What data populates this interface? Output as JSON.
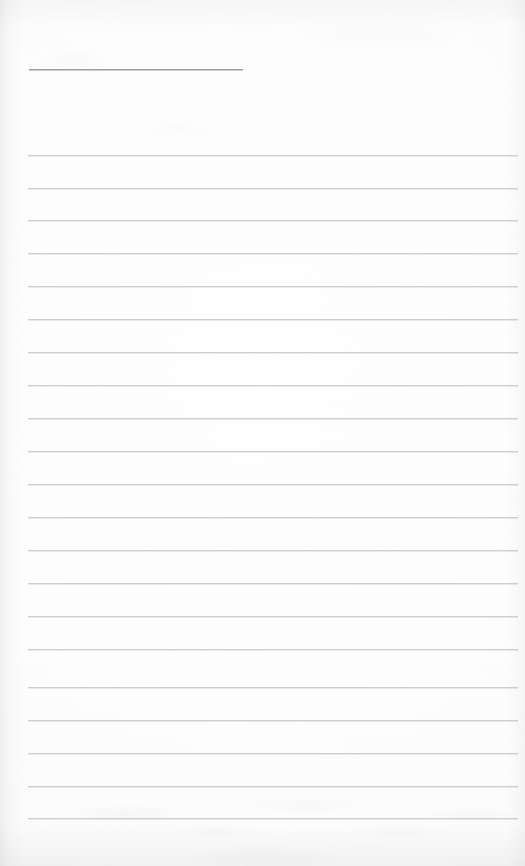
{
  "document": {
    "type": "scanned-lined-notepad-page",
    "title": "",
    "body_text": "",
    "paper_color": "#fdfdfd",
    "rule_color": "#c9c9ce",
    "header_rule_color": "#9a9aa2",
    "width_px": 525,
    "height_px": 866
  },
  "header_rule": {
    "label": "",
    "x": 29,
    "y": 69,
    "width": 214
  },
  "ruled_lines": [
    {
      "label": "",
      "x": 28,
      "y": 155,
      "width": 490
    },
    {
      "label": "",
      "x": 28,
      "y": 188,
      "width": 490
    },
    {
      "label": "",
      "x": 28,
      "y": 220,
      "width": 490
    },
    {
      "label": "",
      "x": 28,
      "y": 253,
      "width": 490
    },
    {
      "label": "",
      "x": 28,
      "y": 286,
      "width": 490
    },
    {
      "label": "",
      "x": 28,
      "y": 319,
      "width": 490
    },
    {
      "label": "",
      "x": 28,
      "y": 352,
      "width": 490
    },
    {
      "label": "",
      "x": 28,
      "y": 385,
      "width": 490
    },
    {
      "label": "",
      "x": 28,
      "y": 418,
      "width": 490
    },
    {
      "label": "",
      "x": 28,
      "y": 451,
      "width": 490
    },
    {
      "label": "",
      "x": 28,
      "y": 484,
      "width": 490
    },
    {
      "label": "",
      "x": 28,
      "y": 517,
      "width": 490
    },
    {
      "label": "",
      "x": 28,
      "y": 550,
      "width": 490
    },
    {
      "label": "",
      "x": 28,
      "y": 583,
      "width": 490
    },
    {
      "label": "",
      "x": 28,
      "y": 616,
      "width": 490
    },
    {
      "label": "",
      "x": 28,
      "y": 649,
      "width": 490
    },
    {
      "label": "",
      "x": 28,
      "y": 687,
      "width": 490
    },
    {
      "label": "",
      "x": 28,
      "y": 720,
      "width": 490
    },
    {
      "label": "",
      "x": 28,
      "y": 753,
      "width": 490
    },
    {
      "label": "",
      "x": 28,
      "y": 786,
      "width": 490
    },
    {
      "label": "",
      "x": 28,
      "y": 818,
      "width": 490
    }
  ]
}
